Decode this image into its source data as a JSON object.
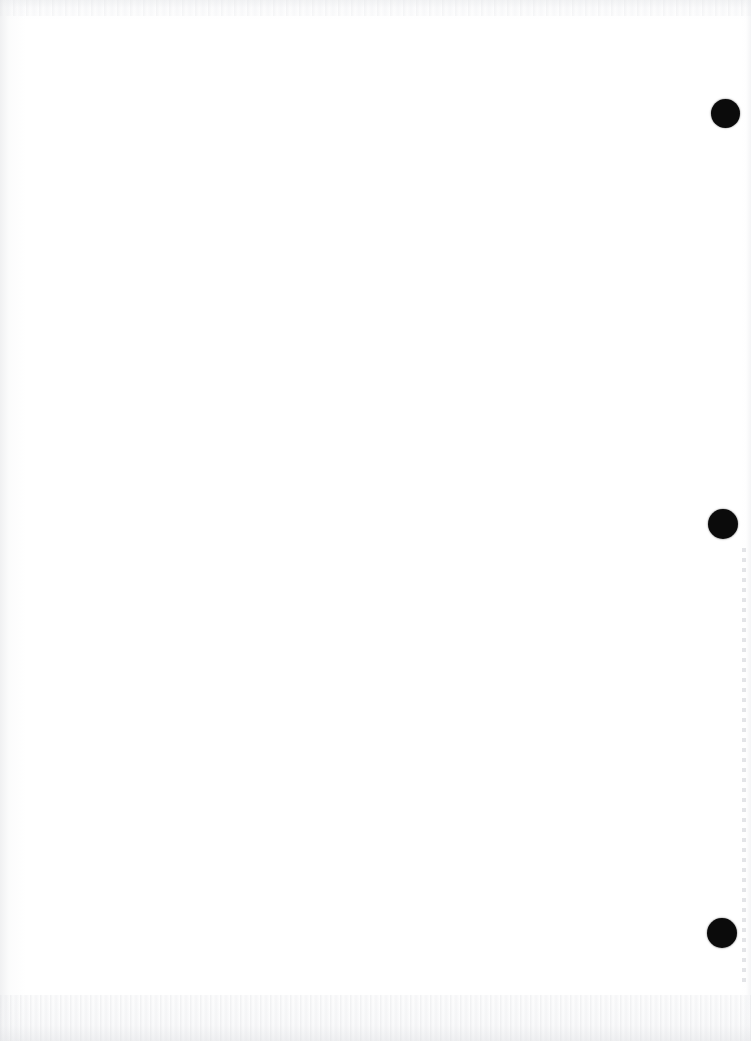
{
  "document": {
    "kind": "scanned-blank-page",
    "page_width": 751,
    "page_height": 1041,
    "paper_color": "#ffffff",
    "ink_color": "#0b0b0b",
    "content_text": "",
    "note": ""
  },
  "bleedthrough": {
    "description": "faint reverse-side ghost text visible through paper",
    "ghost_text": "                                                                    \n                                                                    \n                                                                    "
  },
  "punch_holes": [
    {
      "label": "punch-hole-top",
      "cx": 725,
      "cy": 113,
      "diameter": 29,
      "color": "#0b0b0b"
    },
    {
      "label": "punch-hole-middle",
      "cx": 723,
      "cy": 524,
      "diameter": 30,
      "color": "#0b0b0b"
    },
    {
      "label": "punch-hole-bottom",
      "cx": 722,
      "cy": 933,
      "diameter": 30,
      "color": "#0b0b0b"
    }
  ],
  "perforation": {
    "x": 742,
    "y": 548,
    "height": 440,
    "dot_spacing": 10,
    "color": "#cdcfd4"
  }
}
